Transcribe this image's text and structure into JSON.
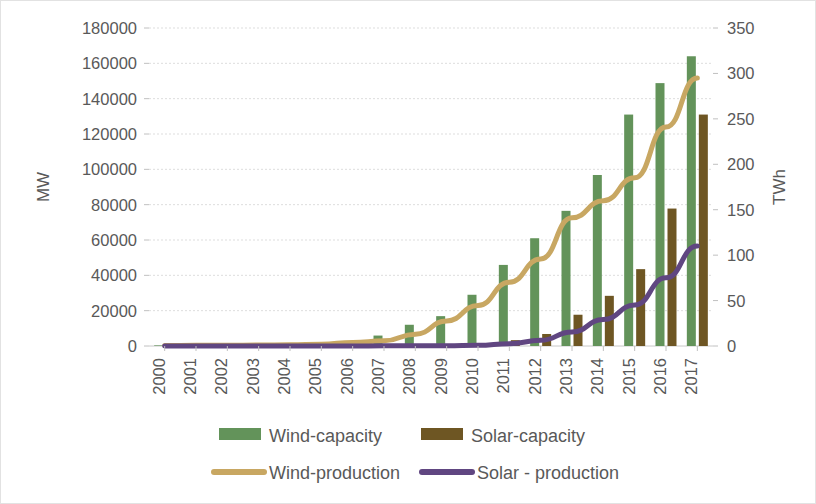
{
  "chart_data": {
    "type": "bar",
    "title": "",
    "subtitle": "",
    "xlabel": "",
    "ylabel": "MW",
    "y2label": "TWh",
    "ylim": [
      0,
      180000
    ],
    "y2lim": [
      0,
      350
    ],
    "ytick_step": 20000,
    "y2tick_step": 50,
    "grid": true,
    "legend_position": "bottom",
    "categories": [
      "2000",
      "2001",
      "2002",
      "2003",
      "2004",
      "2005",
      "2006",
      "2007",
      "2008",
      "2009",
      "2010",
      "2011",
      "2012",
      "2013",
      "2014",
      "2015",
      "2016",
      "2017"
    ],
    "ytick_labels": [
      "0",
      "20000",
      "40000",
      "60000",
      "80000",
      "100000",
      "120000",
      "140000",
      "160000",
      "180000"
    ],
    "y2tick_labels": [
      "0",
      "50",
      "100",
      "150",
      "200",
      "250",
      "300",
      "350"
    ],
    "series": [
      {
        "name": "Wind-capacity",
        "type": "bar",
        "axis": "left",
        "unit": "MW",
        "color": "#63935A",
        "values": [
          340,
          400,
          470,
          570,
          760,
          1270,
          2600,
          5910,
          12020,
          16900,
          29000,
          45900,
          61000,
          76500,
          96800,
          131000,
          148800,
          164000
        ]
      },
      {
        "name": "Solar-capacity",
        "type": "bar",
        "axis": "left",
        "unit": "MW",
        "color": "#6E5623",
        "values": [
          19,
          24,
          45,
          52,
          62,
          68,
          80,
          100,
          140,
          300,
          800,
          3300,
          6800,
          17700,
          28400,
          43500,
          77800,
          131000
        ]
      },
      {
        "name": "Wind-production",
        "type": "line",
        "axis": "right",
        "unit": "TWh",
        "color": "#C8A762",
        "values": [
          0.6,
          0.7,
          0.8,
          1.0,
          1.4,
          2.0,
          3.9,
          5.7,
          13.0,
          27.6,
          44.6,
          70.3,
          95.8,
          141.2,
          159.8,
          185.1,
          241.0,
          295.0
        ]
      },
      {
        "name": "Solar - production",
        "type": "line",
        "axis": "right",
        "unit": "TWh",
        "color": "#604681",
        "values": [
          0.02,
          0.03,
          0.05,
          0.06,
          0.07,
          0.08,
          0.09,
          0.15,
          0.2,
          0.3,
          0.7,
          2.6,
          6.3,
          15.5,
          29.2,
          45.0,
          75.0,
          110.0
        ]
      }
    ],
    "legend_entries": [
      {
        "label": "Wind-capacity",
        "color": "#63935A",
        "marker": "bar"
      },
      {
        "label": "Solar-capacity",
        "color": "#6E5623",
        "marker": "bar"
      },
      {
        "label": "Wind-production",
        "color": "#C8A762",
        "marker": "line"
      },
      {
        "label": "Solar - production",
        "color": "#604681",
        "marker": "line"
      }
    ]
  },
  "figure": {
    "axis_label_left": "MW",
    "axis_label_right": "TWh"
  }
}
